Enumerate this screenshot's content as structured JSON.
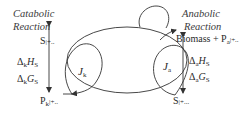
{
  "catabolic": {
    "title_line1": "Catabolic",
    "title_line2": "Reaction",
    "reactant": "S",
    "reactant_tail": "|+..",
    "product": "P",
    "product_sub": "k",
    "product_tail": "|+..",
    "enthalpy_delta": "Δ",
    "enthalpy_sub": "k",
    "enthalpy_sym": "H",
    "enthalpy_subscript": "S",
    "gibbs_delta": "Δ",
    "gibbs_sub": "k",
    "gibbs_sym": "G",
    "gibbs_subscript": "S",
    "flux_symbol": "J",
    "flux_sub": "k"
  },
  "anabolic": {
    "title_line1": "Anabolic",
    "title_line2": "Reaction",
    "product": "Biomass + P",
    "product_sub": "a",
    "product_tail": "|+..",
    "reactant": "S",
    "reactant_tail": "|+...",
    "enthalpy_delta": "Δ",
    "enthalpy_sub": "a",
    "enthalpy_sym": "H",
    "enthalpy_subscript": "S",
    "gibbs_delta": "Δ",
    "gibbs_sub": "a",
    "gibbs_sym": "G",
    "gibbs_subscript": "S",
    "flux_symbol": "J",
    "flux_sub": "a"
  },
  "colors": {
    "line": "#333333",
    "text": "#2a2a2a",
    "background": "#ffffff"
  }
}
